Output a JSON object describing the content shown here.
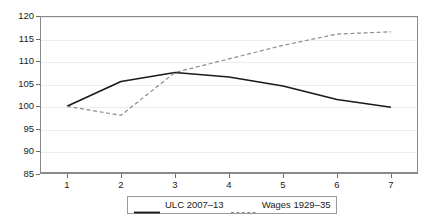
{
  "chart_data": {
    "type": "line",
    "title": "",
    "xlabel": "",
    "ylabel": "",
    "x": [
      1,
      2,
      3,
      4,
      5,
      6,
      7
    ],
    "xtick_labels": [
      "1",
      "2",
      "3",
      "4",
      "5",
      "6",
      "7"
    ],
    "ytick_labels": [
      "85",
      "90",
      "95",
      "100",
      "105",
      "110",
      "115",
      "120"
    ],
    "yticks": [
      85,
      90,
      95,
      100,
      105,
      110,
      115,
      120
    ],
    "xlim": [
      0.5,
      7.5
    ],
    "ylim": [
      85,
      120
    ],
    "grid": true,
    "legend_position": "below-center",
    "series": [
      {
        "name": "ULC 2007–13",
        "values": [
          100.0,
          105.5,
          107.5,
          106.5,
          104.5,
          101.5,
          99.8
        ],
        "style": "solid",
        "color": "#1a1a1a",
        "width": 1.6
      },
      {
        "name": "Wages 1929–35",
        "values": [
          100.0,
          98.0,
          107.5,
          110.5,
          113.5,
          116.0,
          116.5
        ],
        "style": "dashed",
        "color": "#8d8d8d",
        "width": 1.2
      }
    ]
  },
  "legend": {
    "entries": [
      {
        "label": "ULC 2007–13",
        "style": "solid",
        "color": "#1a1a1a"
      },
      {
        "label": "Wages 1929–35",
        "style": "dashed",
        "color": "#8d8d8d"
      }
    ]
  },
  "colors": {
    "series_solid": "#1a1a1a",
    "series_dashed": "#8d8d8d",
    "gridline": "#ededed",
    "axis": "#8a8a8a",
    "text": "#1a1a1a",
    "background": "#ffffff"
  }
}
